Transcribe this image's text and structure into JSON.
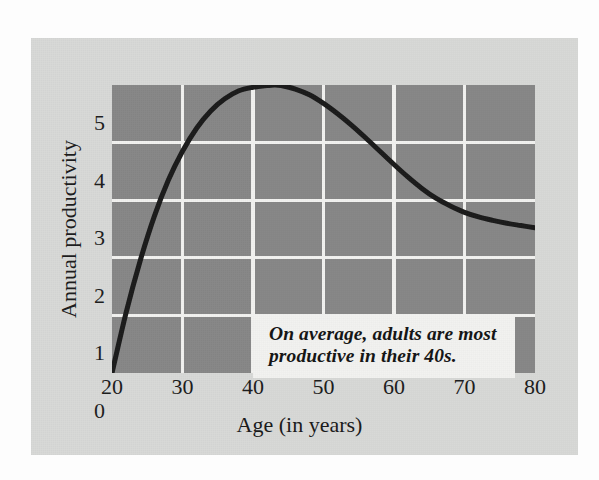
{
  "figure": {
    "background_color": "#fdfdfd",
    "card_color": "#d8d9d7",
    "plot_background_color": "#878787",
    "gridline_color": "#f2f2f0",
    "curve_color": "#1a1a1a",
    "text_color": "#1b1b1b"
  },
  "annotation": {
    "text": "On average, adults are most productive in their 40s.",
    "line1": "On average, adults are most",
    "line2": "productive in their 40s.",
    "background_color": "#f2f2f0"
  },
  "chart_data": {
    "type": "line",
    "title": "",
    "subtitle": "",
    "xlabel": "Age (in years)",
    "ylabel": "Annual productivity",
    "xlim": [
      20,
      80
    ],
    "ylim": [
      0,
      5
    ],
    "xticks": [
      20,
      30,
      40,
      50,
      60,
      70,
      80
    ],
    "xtick_labels": [
      "20",
      "30",
      "40",
      "50",
      "60",
      "70",
      "80"
    ],
    "yticks": [
      0,
      1,
      2,
      3,
      4,
      5
    ],
    "ytick_labels": [
      "0",
      "1",
      "2",
      "3",
      "4",
      "5"
    ],
    "grid": true,
    "grid_color": "#f2f2f0",
    "legend": false,
    "legend_position": "none",
    "annotations": [
      {
        "text": "On average, adults are most productive in their 40s.",
        "x": 44,
        "y": 1.4
      }
    ],
    "series": [
      {
        "name": "Annual productivity",
        "color": "#1a1a1a",
        "line_width": 5,
        "x": [
          20,
          22,
          24,
          26,
          28,
          30,
          32,
          34,
          36,
          38,
          40,
          42,
          43,
          44,
          46,
          48,
          50,
          52,
          54,
          56,
          58,
          60,
          62,
          64,
          66,
          68,
          70,
          72,
          74,
          76,
          78,
          80
        ],
        "y": [
          0.0,
          1.05,
          1.95,
          2.72,
          3.35,
          3.85,
          4.25,
          4.55,
          4.76,
          4.9,
          4.96,
          4.99,
          5.0,
          4.99,
          4.93,
          4.83,
          4.68,
          4.5,
          4.3,
          4.08,
          3.85,
          3.62,
          3.4,
          3.2,
          3.03,
          2.9,
          2.79,
          2.71,
          2.65,
          2.6,
          2.56,
          2.52
        ]
      }
    ]
  }
}
